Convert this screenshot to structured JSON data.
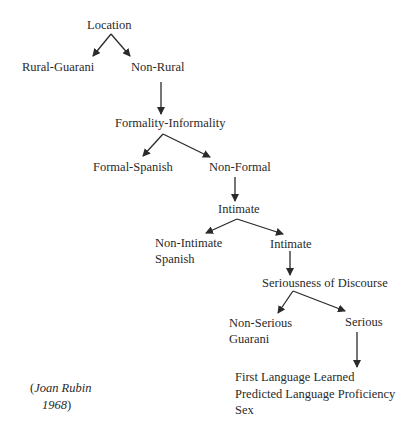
{
  "diagram": {
    "type": "decision-tree",
    "nodes": {
      "location": "Location",
      "rural_guarani": "Rural-Guarani",
      "non_rural": "Non-Rural",
      "formality": "Formality-Informality",
      "formal_spanish": "Formal-Spanish",
      "non_formal": "Non-Formal",
      "intimate_q": "Intimate",
      "non_intimate_line1": "Non-Intimate",
      "non_intimate_line2": "Spanish",
      "intimate": "Intimate",
      "seriousness": "Seriousness of Discourse",
      "non_serious_line1": "Non-Serious",
      "non_serious_line2": "Guarani",
      "serious": "Serious",
      "factors": [
        "First Language Learned",
        "Predicted Language Proficiency",
        "Sex"
      ]
    },
    "edges": [
      [
        "Location",
        "Rural-Guarani"
      ],
      [
        "Location",
        "Non-Rural"
      ],
      [
        "Non-Rural",
        "Formality-Informality"
      ],
      [
        "Formality-Informality",
        "Formal-Spanish"
      ],
      [
        "Formality-Informality",
        "Non-Formal"
      ],
      [
        "Non-Formal",
        "Intimate"
      ],
      [
        "Intimate",
        "Non-Intimate Spanish"
      ],
      [
        "Intimate",
        "Intimate"
      ],
      [
        "Intimate",
        "Seriousness of Discourse"
      ],
      [
        "Seriousness of Discourse",
        "Non-Serious Guarani"
      ],
      [
        "Seriousness of Discourse",
        "Serious"
      ],
      [
        "Serious",
        "First Language Learned / Predicted Language Proficiency / Sex"
      ]
    ],
    "citation": {
      "open_paren": "(",
      "author": "Joan Rubin",
      "year": "1968",
      "close_paren": ")"
    },
    "colors": {
      "text": "#2a2a2a",
      "arrow": "#2a2a2a",
      "background": "#ffffff"
    }
  }
}
